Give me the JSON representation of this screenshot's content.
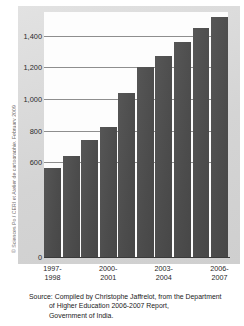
{
  "credit": {
    "text": "© Sciences Po / CERI et Atelier de cartographie, February 2009"
  },
  "source": {
    "line1": "Source: Compiled by Christophe Jaffrelot, from the Department",
    "line2": "of Higher Education 2006-2007 Report,",
    "line3": "Government of India."
  },
  "colors": {
    "bar": "#4f4f4f",
    "panel": "#d9d9d9",
    "plot_background": "#fdfdfd",
    "gridline": "#8e8e8e",
    "axis": "#3a3a3a",
    "text": "#1a1a1a"
  },
  "chart_data": {
    "type": "bar",
    "title": "",
    "xlabel": "",
    "ylabel": "",
    "categories": [
      "1997-1998",
      "1998-1999",
      "1999-2000",
      "2000-2001",
      "2001-2002",
      "2002-2003",
      "2003-2004",
      "2004-2005",
      "2005-2006",
      "2006-2007"
    ],
    "values": [
      565,
      640,
      740,
      825,
      1040,
      1200,
      1270,
      1360,
      1450,
      1520
    ],
    "ylim": [
      0,
      1550
    ],
    "yticks": [
      0,
      600,
      800,
      1000,
      1200,
      1400
    ],
    "ytick_labels": [
      "0",
      "600",
      "800",
      "1,000",
      "1,200",
      "1,400"
    ],
    "xtick_labels": [
      {
        "top": "1997-",
        "bottom": "1998"
      },
      {
        "top": "2000-",
        "bottom": "2001"
      },
      {
        "top": "2003-",
        "bottom": "2004"
      },
      {
        "top": "2006-",
        "bottom": "2007"
      }
    ],
    "grid": true,
    "legend": "none"
  }
}
